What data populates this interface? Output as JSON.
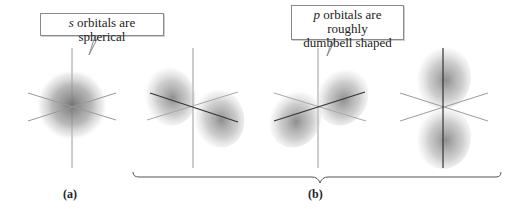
{
  "callouts": {
    "s": {
      "italic": "s",
      "text": " orbitals are spherical"
    },
    "p": {
      "italic": "p",
      "line1": " orbitals are roughly",
      "line2": "dumbbell shaped"
    }
  },
  "labels": {
    "a": "(a)",
    "b": "(b)"
  },
  "orbitals": [
    {
      "name": "s-orbital",
      "type": "s",
      "cx": 72,
      "cy": 105
    },
    {
      "name": "px-orbital",
      "type": "p",
      "cx": 193,
      "cy": 107
    },
    {
      "name": "py-orbital",
      "type": "p",
      "cx": 318,
      "cy": 107
    },
    {
      "name": "pz-orbital",
      "type": "p",
      "cx": 443,
      "cy": 107
    }
  ],
  "colors": {
    "axis": "#8a8a8a",
    "axis_dark": "#333333",
    "cloud": "#7a7a7a",
    "text": "#222222"
  }
}
